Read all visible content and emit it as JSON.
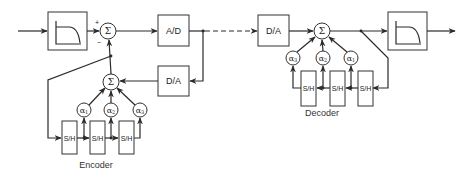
{
  "diagram": {
    "type": "block-diagram",
    "encoder": {
      "caption": "Encoder",
      "input_filter_icon": "lowpass-filter-icon",
      "summer_symbol": "Σ",
      "plus_sign": "+",
      "minus_sign": "−",
      "ad_label": "A/D",
      "da_label": "D/A",
      "predictor_summer_symbol": "Σ",
      "coefficients": [
        "α1",
        "α2",
        "α3"
      ],
      "coef_base": "α",
      "coef_subs": [
        "1",
        "2",
        "3"
      ],
      "sample_hold": [
        "S/H",
        "S/H",
        "S/H"
      ]
    },
    "channel": {
      "style": "dashed"
    },
    "decoder": {
      "caption": "Decoder",
      "da_label": "D/A",
      "summer_symbol": "Σ",
      "coefficients": [
        "α3",
        "α2",
        "α1"
      ],
      "coef_base": "α",
      "coef_subs": [
        "3",
        "2",
        "1"
      ],
      "sample_hold": [
        "S/H",
        "S/H",
        "S/H"
      ],
      "output_filter_icon": "lowpass-filter-icon"
    }
  }
}
